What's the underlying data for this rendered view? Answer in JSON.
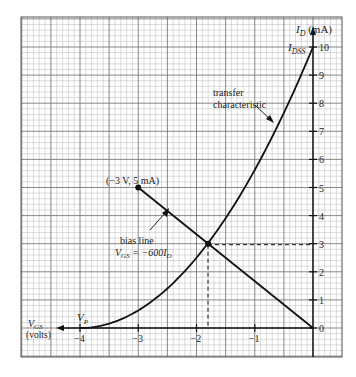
{
  "chart_data": {
    "type": "line",
    "title": "",
    "xlabel": "V_GS (volts)",
    "ylabel": "I_D (mA)",
    "xlim": [
      -4.0,
      0.0
    ],
    "ylim": [
      0,
      10
    ],
    "x_ticks": [
      -4,
      -3,
      -2,
      -1
    ],
    "y_ticks": [
      0,
      1,
      2,
      3,
      4,
      5,
      6,
      7,
      8,
      9,
      10
    ],
    "grid": true,
    "series": [
      {
        "name": "transfer characteristic",
        "formula": "I_D = I_DSS (1 - V_GS/V_P)^2",
        "I_DSS_mA": 10,
        "V_P_volts": -4,
        "x": [
          -4.0,
          -3.5,
          -3.0,
          -2.5,
          -2.0,
          -1.8,
          -1.5,
          -1.0,
          -0.5,
          0.0
        ],
        "y": [
          0.0,
          0.156,
          0.625,
          1.406,
          2.5,
          3.025,
          3.906,
          5.625,
          7.656,
          10.0
        ]
      },
      {
        "name": "bias line",
        "equation": "V_GS = -600 I_D",
        "x": [
          -3.0,
          0.0
        ],
        "y": [
          5.0,
          0.0
        ]
      }
    ],
    "annotations": [
      {
        "text": "(-3 V, 5 mA)",
        "x": -3.0,
        "y": 5.0,
        "marker": "dot"
      },
      {
        "text": "transfer characteristic",
        "arrow_to": "transfer characteristic curve"
      },
      {
        "text": "bias line",
        "arrow_to": "bias line"
      },
      {
        "text": "V_GS = -600I_D"
      },
      {
        "text": "I_DSS",
        "x": 0.0,
        "y": 10.0
      },
      {
        "text": "V_P",
        "x": -4.0,
        "y": 0.0
      },
      {
        "text": "Q-point",
        "x": -1.8,
        "y": 3.0,
        "marker": "dot",
        "dashed_projection": true
      }
    ]
  },
  "labels": {
    "y_axis_main": "I",
    "y_axis_sub": "D",
    "y_axis_unit": " (mA)",
    "idss_main": "I",
    "idss_sub": "DSS",
    "vp_main": "V",
    "vp_sub": "P",
    "x_axis_main": "V",
    "x_axis_sub": "GS",
    "x_axis_unit": "(volts)",
    "point_label": "(−3 V, 5 mA)",
    "transfer_line1": "transfer",
    "transfer_line2": "characteristic",
    "bias_line1": "bias line",
    "bias_eq_main": "V",
    "bias_eq_sub": "GS",
    "bias_eq_rest": " = −600",
    "bias_eq_i": "I",
    "bias_eq_isub": "D",
    "x_tick_labels": [
      "−4",
      "−3",
      "−2",
      "−1"
    ],
    "y_tick_labels": [
      "0",
      "1",
      "2",
      "3",
      "4",
      "5",
      "6",
      "7",
      "8",
      "9",
      "10"
    ]
  },
  "colors": {
    "grid_minor": "#b8b8b8",
    "grid_major": "#6a6a6a",
    "curve": "#111111",
    "background": "#ffffff"
  }
}
